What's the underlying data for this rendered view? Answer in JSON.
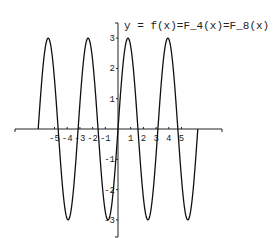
{
  "chart_data": {
    "type": "line",
    "title": "y = f(x)=F_4(x)=F_8(x)",
    "function": "3*sin(2*x)",
    "x_range": [
      -6.2832,
      6.2832
    ],
    "xlim": [
      -8.3,
      8.0
    ],
    "ylim": [
      -3.5,
      3.5
    ],
    "xlabel": "",
    "ylabel": "",
    "x_ticks": [
      -5,
      -4,
      -3,
      -2,
      -1,
      1,
      2,
      3,
      4,
      5
    ],
    "y_ticks": [
      -3,
      -2,
      -1,
      1,
      2,
      3
    ],
    "grid": false,
    "legend": null,
    "series": [
      {
        "name": "f(x)",
        "x": [
          -6.28,
          -5.5,
          -4.71,
          -3.93,
          -3.14,
          -2.36,
          -1.57,
          -0.79,
          0,
          0.79,
          1.57,
          2.36,
          3.14,
          3.93,
          4.71,
          5.5,
          6.28
        ],
        "y": [
          0,
          3,
          0,
          -3,
          0,
          3,
          0,
          -3,
          0,
          3,
          0,
          -3,
          0,
          3,
          0,
          -3,
          0
        ]
      }
    ],
    "color": "#111111"
  }
}
